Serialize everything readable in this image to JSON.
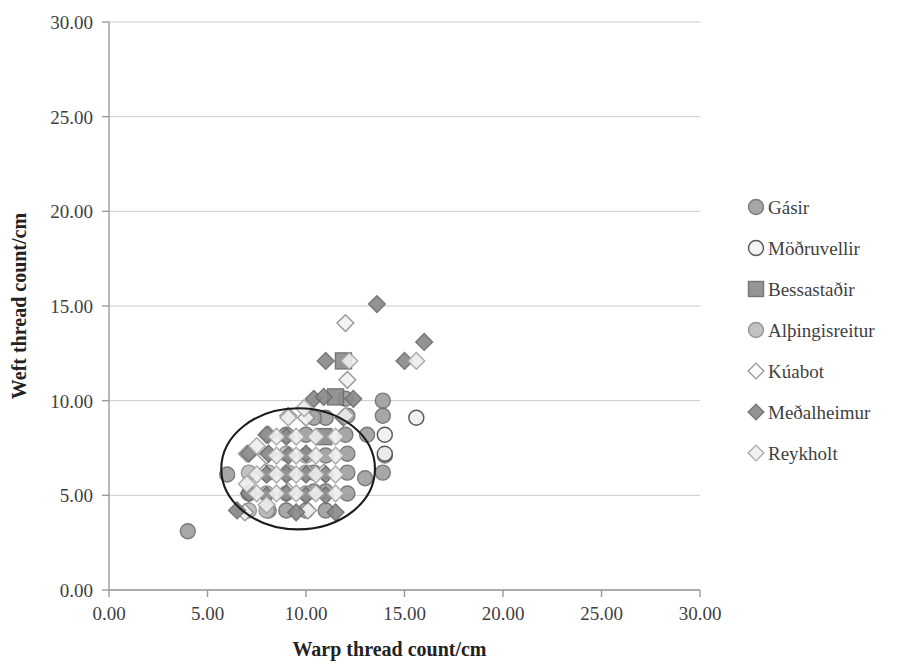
{
  "chart_data": {
    "type": "scatter",
    "title": "",
    "xlabel": "Warp thread count/cm",
    "ylabel": "Weft thread count/cm",
    "xlim": [
      0,
      30
    ],
    "ylim": [
      0,
      30
    ],
    "xticks": [
      "0.00",
      "5.00",
      "10.00",
      "15.00",
      "20.00",
      "25.00",
      "30.00"
    ],
    "yticks": [
      "0.00",
      "5.00",
      "10.00",
      "15.00",
      "20.00",
      "25.00",
      "30.00"
    ],
    "xtick_values": [
      0,
      5,
      10,
      15,
      20,
      25,
      30
    ],
    "ytick_values": [
      0,
      5,
      10,
      15,
      20,
      25,
      30
    ],
    "grid": "horizontal",
    "legend_position": "right",
    "annotation": {
      "type": "ellipse",
      "label": "cluster-ellipse",
      "center_x": 9.6,
      "center_y": 6.4,
      "radius_x": 3.9,
      "radius_y": 3.2
    },
    "series": [
      {
        "name": "Gásir",
        "marker": "circle",
        "fill": "#a0a0a0",
        "stroke": "#6f6f6f",
        "size": 15,
        "points": [
          [
            4.0,
            3.1
          ],
          [
            6.0,
            6.1
          ],
          [
            14.0,
            7.1
          ],
          [
            13.9,
            6.2
          ],
          [
            12.0,
            10.1
          ],
          [
            13.9,
            10.0
          ],
          [
            13.9,
            9.2
          ],
          [
            12.1,
            9.2
          ],
          [
            11.0,
            9.1
          ],
          [
            10.4,
            9.1
          ],
          [
            12.0,
            8.2
          ],
          [
            13.1,
            8.2
          ],
          [
            12.1,
            7.2
          ],
          [
            11.0,
            7.1
          ],
          [
            12.1,
            6.2
          ],
          [
            13.0,
            5.9
          ],
          [
            11.0,
            5.2
          ],
          [
            12.1,
            5.1
          ],
          [
            10.0,
            4.2
          ],
          [
            11.0,
            4.2
          ],
          [
            9.0,
            4.2
          ],
          [
            8.1,
            4.2
          ],
          [
            7.1,
            5.1
          ],
          [
            10.0,
            8.2
          ],
          [
            9.0,
            8.2
          ],
          [
            10.4,
            6.2
          ],
          [
            10.4,
            5.2
          ]
        ]
      },
      {
        "name": "Möðruvellir",
        "marker": "circle-open",
        "fill": "#f0f0f0",
        "stroke": "#4a4a4a",
        "size": 15,
        "points": [
          [
            15.6,
            9.1
          ],
          [
            14.0,
            8.2
          ],
          [
            14.0,
            7.2
          ]
        ]
      },
      {
        "name": "Bessastaðir",
        "marker": "square",
        "fill": "#8d8d8d",
        "stroke": "#6a6a6a",
        "size": 16,
        "points": [
          [
            11.9,
            12.1
          ],
          [
            11.5,
            10.2
          ],
          [
            10.9,
            8.1
          ]
        ]
      },
      {
        "name": "Alþingisreitur",
        "marker": "circle",
        "fill": "#bdbdbd",
        "stroke": "#8e8e8e",
        "size": 15,
        "points": [
          [
            7.1,
            6.2
          ],
          [
            8.0,
            5.1
          ],
          [
            8.0,
            4.2
          ],
          [
            9.0,
            5.1
          ],
          [
            9.1,
            6.2
          ],
          [
            10.0,
            5.1
          ],
          [
            10.0,
            6.2
          ],
          [
            10.0,
            7.1
          ],
          [
            9.0,
            7.2
          ],
          [
            8.1,
            6.2
          ],
          [
            7.1,
            4.2
          ]
        ]
      },
      {
        "name": "Kúabot",
        "marker": "diamond-open",
        "fill": "#f2f2f2",
        "stroke": "#8f8f8f",
        "size": 16,
        "points": [
          [
            12.0,
            14.1
          ],
          [
            12.1,
            11.1
          ],
          [
            9.1,
            9.2
          ],
          [
            7.0,
            7.2
          ],
          [
            6.9,
            4.1
          ],
          [
            8.0,
            7.1
          ],
          [
            9.0,
            6.2
          ],
          [
            10.0,
            9.1
          ],
          [
            8.1,
            8.2
          ],
          [
            9.1,
            5.2
          ],
          [
            7.9,
            6.2
          ],
          [
            10.9,
            6.2
          ],
          [
            10.1,
            4.2
          ]
        ]
      },
      {
        "name": "Meðalheimur",
        "marker": "diamond",
        "fill": "#8a8a8a",
        "stroke": "#6b6b6b",
        "size": 16,
        "points": [
          [
            13.6,
            15.1
          ],
          [
            16.0,
            13.1
          ],
          [
            15.0,
            12.1
          ],
          [
            11.0,
            12.1
          ],
          [
            12.4,
            10.1
          ],
          [
            10.4,
            10.1
          ],
          [
            10.9,
            10.2
          ],
          [
            9.0,
            8.1
          ],
          [
            8.0,
            8.2
          ],
          [
            11.9,
            9.1
          ],
          [
            10.0,
            7.2
          ],
          [
            9.1,
            7.1
          ],
          [
            8.1,
            7.2
          ],
          [
            7.1,
            7.2
          ],
          [
            9.0,
            6.1
          ],
          [
            8.0,
            6.1
          ],
          [
            10.0,
            6.1
          ],
          [
            11.0,
            6.1
          ],
          [
            9.0,
            5.1
          ],
          [
            10.0,
            5.0
          ],
          [
            11.0,
            5.0
          ],
          [
            8.0,
            5.0
          ],
          [
            7.1,
            5.1
          ],
          [
            6.5,
            4.2
          ],
          [
            9.5,
            4.1
          ],
          [
            11.5,
            4.1
          ]
        ]
      },
      {
        "name": "Reykholt",
        "marker": "diamond-open",
        "fill": "#ededed",
        "stroke": "#a4a4a4",
        "size": 16,
        "points": [
          [
            9.1,
            9.1
          ],
          [
            12.2,
            12.1
          ],
          [
            10.5,
            8.1
          ],
          [
            11.5,
            8.1
          ],
          [
            9.5,
            8.1
          ],
          [
            8.5,
            8.1
          ],
          [
            15.6,
            12.1
          ],
          [
            11.5,
            7.1
          ],
          [
            10.5,
            7.1
          ],
          [
            9.5,
            7.1
          ],
          [
            8.5,
            7.1
          ],
          [
            7.5,
            6.1
          ],
          [
            8.5,
            6.1
          ],
          [
            9.5,
            6.1
          ],
          [
            10.5,
            6.1
          ],
          [
            11.5,
            6.1
          ],
          [
            7.5,
            5.1
          ],
          [
            8.5,
            5.1
          ],
          [
            9.5,
            5.1
          ],
          [
            10.5,
            5.1
          ],
          [
            11.5,
            5.1
          ],
          [
            8.0,
            4.5
          ],
          [
            7.0,
            5.6
          ],
          [
            7.5,
            7.6
          ],
          [
            9.9,
            9.6
          ],
          [
            12.0,
            9.2
          ]
        ]
      }
    ]
  },
  "legend": {
    "items": [
      {
        "label": "Gásir",
        "marker": "circle",
        "fill": "#a0a0a0",
        "stroke": "#6f6f6f"
      },
      {
        "label": "Möðruvellir",
        "marker": "circle-open",
        "fill": "#f4f4f4",
        "stroke": "#4a4a4a"
      },
      {
        "label": "Bessastaðir",
        "marker": "square",
        "fill": "#8d8d8d",
        "stroke": "#6a6a6a"
      },
      {
        "label": "Alþingisreitur",
        "marker": "circle",
        "fill": "#bdbdbd",
        "stroke": "#8e8e8e"
      },
      {
        "label": "Kúabot",
        "marker": "diamond-open",
        "fill": "#fafafa",
        "stroke": "#8f8f8f"
      },
      {
        "label": "Meðalheimur",
        "marker": "diamond",
        "fill": "#8a8a8a",
        "stroke": "#6b6b6b"
      },
      {
        "label": "Reykholt",
        "marker": "diamond-open",
        "fill": "#f0f0f0",
        "stroke": "#a4a4a4"
      }
    ]
  },
  "plot_geometry": {
    "left": 109,
    "right": 700,
    "top": 22,
    "bottom": 590,
    "legend_x": 748,
    "legend_y_start": 207,
    "legend_row_height": 41
  }
}
